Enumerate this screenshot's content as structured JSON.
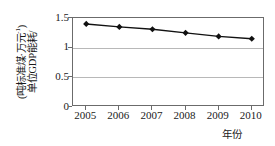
{
  "chart_data": {
    "type": "line",
    "title": "",
    "xlabel": "年份",
    "ylabel": "单位GDP能耗/(吨标准煤·万元⁻¹)",
    "ylabel_lines": [
      "单位GDP能耗/",
      "(吨标准煤·万元⁻¹)"
    ],
    "categories": [
      "2005",
      "2006",
      "2007",
      "2008",
      "2009",
      "2010"
    ],
    "x": [
      2005,
      2006,
      2007,
      2008,
      2009,
      2010
    ],
    "values": [
      1.4,
      1.35,
      1.31,
      1.25,
      1.19,
      1.15
    ],
    "series": [
      {
        "name": "单位GDP能耗",
        "values": [
          1.4,
          1.35,
          1.31,
          1.25,
          1.19,
          1.15
        ]
      }
    ],
    "ylim": [
      0,
      1.5
    ],
    "yticks": [
      0,
      0.5,
      1,
      1.5
    ],
    "ytick_labels": [
      "0",
      "0.5",
      "1",
      "1.5"
    ],
    "xlim": [
      2004.6,
      2010.4
    ],
    "grid": true,
    "grid_axis": "y",
    "legend": false,
    "marker": "diamond",
    "marker_color": "#111111",
    "line_color": "#111111",
    "frame_color": "#6b6b6b",
    "grid_color": "#b8b8b8",
    "background_color": "#ffffff"
  },
  "axis": {
    "y_caption_line1": "单位GDP能耗/",
    "y_caption_line2_prefix": "(吨标准煤·万元",
    "y_caption_line2_sup": "-1",
    "y_caption_line2_suffix": ")",
    "x_caption": "年份"
  }
}
